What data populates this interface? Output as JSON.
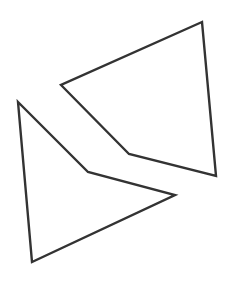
{
  "diagram": {
    "title": "",
    "shapes": [
      {
        "name": "upper-quadrilateral",
        "kind": "concave-quadrilateral",
        "filled": false
      },
      {
        "name": "lower-quadrilateral",
        "kind": "concave-quadrilateral",
        "filled": false
      }
    ],
    "colors": {
      "stroke": "#333333",
      "background": "#ffffff"
    }
  }
}
